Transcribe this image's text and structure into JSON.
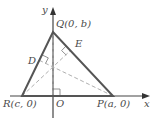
{
  "diagram": {
    "title": "",
    "axes": {
      "x_label": "x",
      "y_label": "y",
      "origin_label": "O"
    },
    "points": {
      "Q": {
        "label": "Q(0, b)",
        "name": "Q",
        "coords": "(0, b)"
      },
      "R": {
        "label": "R(c, 0)",
        "name": "R",
        "coords": "(c, 0)"
      },
      "P": {
        "label": "P(a, 0)",
        "name": "P",
        "coords": "(a, 0)"
      },
      "D": {
        "label": "D"
      },
      "E": {
        "label": "E"
      }
    },
    "colors": {
      "triangle": "#555555",
      "axis": "#444444",
      "altitude": "#b0b0b0",
      "text": "#4a4a4a"
    }
  }
}
